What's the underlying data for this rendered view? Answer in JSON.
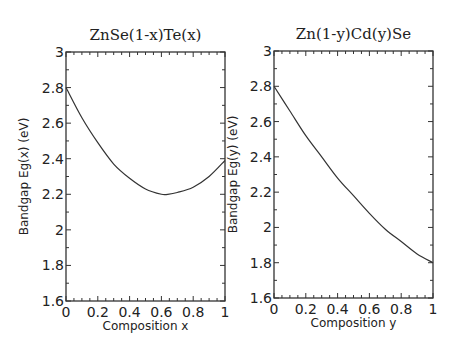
{
  "chart_data": [
    {
      "type": "line",
      "title": "ZnSe(1-x)Te(x)",
      "xlabel": "Composition x",
      "ylabel": "Bandgap Eg(x) (eV)",
      "xlim": [
        0,
        1
      ],
      "ylim": [
        1.6,
        3
      ],
      "xticks": [
        "0",
        "0.2",
        "0.4",
        "0.6",
        "0.8",
        "1"
      ],
      "yticks": [
        "1.6",
        "1.8",
        "2",
        "2.2",
        "2.4",
        "2.6",
        "2.8",
        "3"
      ],
      "grid": false,
      "x": [
        0,
        0.1,
        0.2,
        0.3,
        0.4,
        0.5,
        0.6,
        0.64,
        0.7,
        0.8,
        0.9,
        1.0
      ],
      "values": [
        2.8,
        2.63,
        2.49,
        2.37,
        2.29,
        2.23,
        2.2,
        2.2,
        2.21,
        2.24,
        2.3,
        2.39
      ]
    },
    {
      "type": "line",
      "title": "Zn(1-y)Cd(y)Se",
      "xlabel": "Composition y",
      "ylabel": "Bandgap Eg(y) (eV)",
      "xlim": [
        0,
        1
      ],
      "ylim": [
        1.6,
        3
      ],
      "xticks": [
        "0",
        "0.2",
        "0.4",
        "0.6",
        "0.8",
        "1"
      ],
      "yticks": [
        "1.6",
        "1.8",
        "2",
        "2.2",
        "2.4",
        "2.6",
        "2.8",
        "3"
      ],
      "grid": false,
      "x": [
        0,
        0.1,
        0.2,
        0.3,
        0.4,
        0.5,
        0.6,
        0.7,
        0.8,
        0.9,
        1.0
      ],
      "values": [
        2.8,
        2.66,
        2.52,
        2.4,
        2.28,
        2.18,
        2.08,
        1.99,
        1.92,
        1.85,
        1.8
      ]
    }
  ]
}
